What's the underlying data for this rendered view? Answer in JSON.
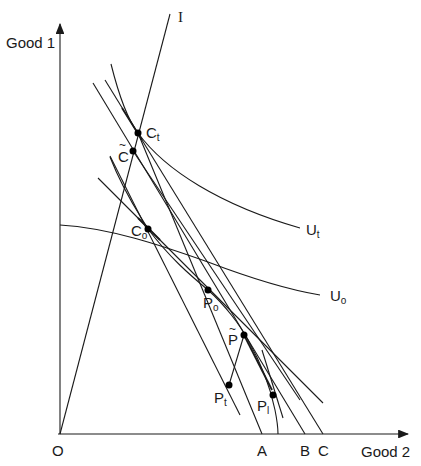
{
  "axes": {
    "y_label": "Good 1",
    "x_label": "Good 2",
    "origin_label": "O"
  },
  "ray": {
    "label": "I"
  },
  "indifference_curves": [
    {
      "id": "U1",
      "label": "U",
      "sub": "t"
    },
    {
      "id": "U0",
      "label": "U",
      "sub": "o"
    }
  ],
  "points": {
    "Ct": {
      "label": "C",
      "sub": "t"
    },
    "Ctilde": {
      "label": "C",
      "tilde": "~"
    },
    "Co": {
      "label": "C",
      "sub": "o"
    },
    "Po": {
      "label": "P",
      "sub": "o"
    },
    "Ptilde": {
      "label": "P",
      "tilde": "~"
    },
    "Pt": {
      "label": "P",
      "sub": "t"
    },
    "P1": {
      "label": "P",
      "sub": "l"
    }
  },
  "x_axis_marks": [
    "A",
    "B",
    "C"
  ],
  "colors": {
    "ink": "#1a1a1a",
    "background": "#ffffff"
  }
}
